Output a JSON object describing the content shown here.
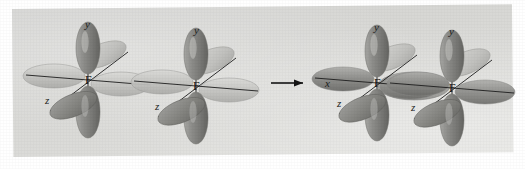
{
  "figure": {
    "kind": "orbital-overlap-diagram",
    "background_color": "#ffffff",
    "plate_color": "#d8d8d5",
    "orbital_color": "#8b8b8b",
    "orbital_highlight_color": "#c9c9c6",
    "orbital_shadow_color": "#6a6a6a",
    "axis_color": "#1c1c1c",
    "label_color": "#141414"
  },
  "reactants": {
    "atom_1": {
      "element": "F",
      "axes": {
        "y": "y",
        "z": "z"
      }
    },
    "atom_2": {
      "element": "F",
      "axes": {
        "y": "y",
        "z": "z"
      }
    }
  },
  "arrow": {
    "symbol": "→",
    "direction": "right",
    "meaning": "forms"
  },
  "product": {
    "atom_1": {
      "element": "F",
      "axes": {
        "x": "x",
        "y": "y",
        "z": "z"
      }
    },
    "atom_2": {
      "element": "F",
      "axes": {
        "y": "y",
        "z": "z"
      }
    }
  }
}
